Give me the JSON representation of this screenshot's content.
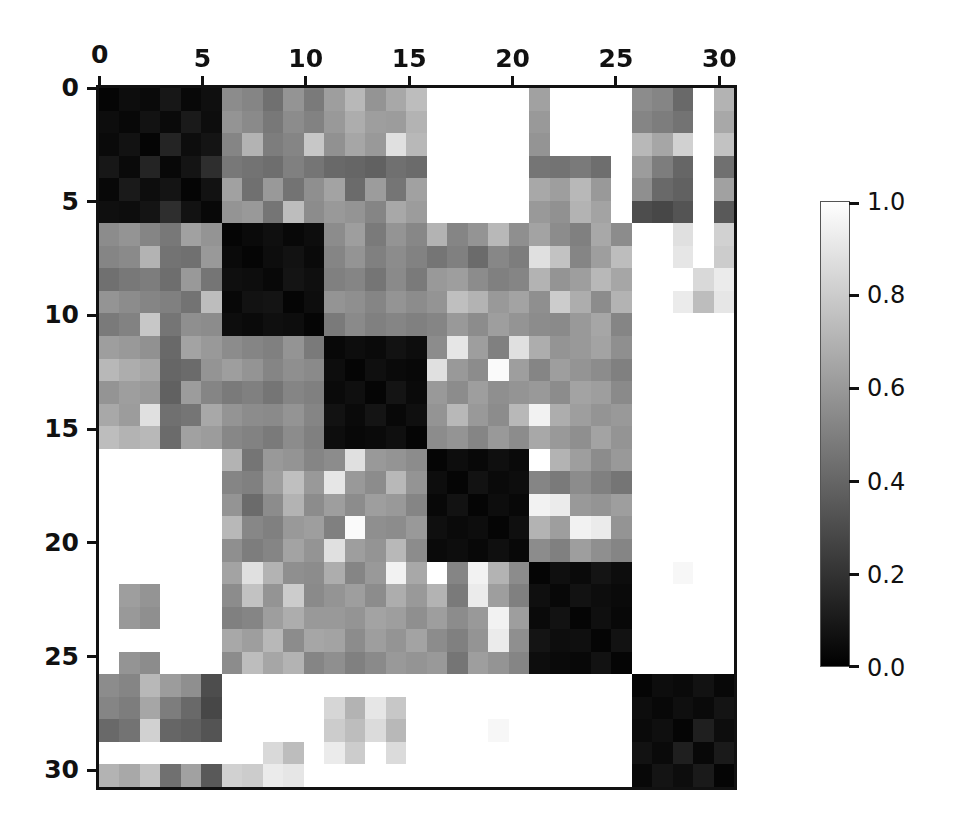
{
  "figure": {
    "type": "heatmap",
    "background": "#ffffff"
  },
  "chart_data": {
    "type": "heatmap",
    "title": "",
    "xlabel": "",
    "ylabel": "",
    "colormap": "gray",
    "vmin": 0.0,
    "vmax": 1.0,
    "grid": false,
    "n_rows": 31,
    "n_cols": 31,
    "x_tick_values": [
      0,
      5,
      10,
      15,
      20,
      25,
      30
    ],
    "y_tick_values": [
      0,
      5,
      10,
      15,
      20,
      25,
      30
    ],
    "x_tick_labels": [
      "0",
      "5",
      "10",
      "15",
      "20",
      "25",
      "30"
    ],
    "y_tick_labels": [
      "0",
      "5",
      "10",
      "15",
      "20",
      "25",
      "30"
    ],
    "x_axis_position": "top",
    "y_axis_position": "left",
    "xlim": [
      0,
      31
    ],
    "ylim": [
      31,
      0
    ],
    "legend_position": "right",
    "colorbar": {
      "orientation": "vertical",
      "tick_values": [
        0.0,
        0.2,
        0.4,
        0.6,
        0.8,
        1.0
      ],
      "tick_labels": [
        "0.0",
        "0.2",
        "0.4",
        "0.6",
        "0.8",
        "1.0"
      ],
      "low_color": "#000000",
      "high_color": "#ffffff"
    },
    "block_structure": {
      "description": "block-diagonal clustered dissimilarity matrix",
      "blocks": [
        [
          0,
          5
        ],
        [
          6,
          10
        ],
        [
          11,
          15
        ],
        [
          16,
          20
        ],
        [
          21,
          25
        ],
        [
          26,
          30
        ]
      ]
    },
    "values": [
      [
        0.02,
        0.05,
        0.04,
        0.09,
        0.03,
        0.06,
        0.55,
        0.52,
        0.44,
        0.58,
        0.48,
        0.62,
        0.72,
        0.58,
        0.66,
        0.74,
        1.0,
        1.0,
        1.0,
        1.0,
        1.0,
        0.63,
        1.0,
        1.0,
        1.0,
        1.0,
        0.55,
        0.52,
        0.41,
        1.0,
        0.7
      ],
      [
        0.05,
        0.03,
        0.07,
        0.04,
        0.1,
        0.05,
        0.58,
        0.54,
        0.47,
        0.55,
        0.51,
        0.6,
        0.68,
        0.62,
        0.61,
        0.7,
        1.0,
        1.0,
        1.0,
        1.0,
        1.0,
        0.6,
        1.0,
        1.0,
        1.0,
        1.0,
        0.52,
        0.49,
        0.45,
        1.0,
        0.66
      ],
      [
        0.04,
        0.07,
        0.02,
        0.14,
        0.05,
        0.08,
        0.52,
        0.7,
        0.49,
        0.52,
        0.78,
        0.57,
        0.65,
        0.6,
        0.88,
        0.72,
        1.0,
        1.0,
        1.0,
        1.0,
        1.0,
        0.58,
        1.0,
        1.0,
        1.0,
        1.0,
        0.72,
        0.65,
        0.82,
        1.0,
        0.76
      ],
      [
        0.09,
        0.04,
        0.14,
        0.03,
        0.08,
        0.18,
        0.47,
        0.45,
        0.43,
        0.5,
        0.46,
        0.41,
        0.4,
        0.38,
        0.44,
        0.42,
        1.0,
        1.0,
        1.0,
        1.0,
        1.0,
        0.46,
        0.45,
        0.48,
        0.43,
        1.0,
        0.61,
        0.49,
        0.4,
        1.0,
        0.44
      ],
      [
        0.03,
        0.1,
        0.05,
        0.08,
        0.02,
        0.07,
        0.63,
        0.44,
        0.6,
        0.45,
        0.56,
        0.64,
        0.42,
        0.61,
        0.46,
        0.63,
        1.0,
        1.0,
        1.0,
        1.0,
        1.0,
        0.66,
        0.62,
        0.72,
        0.6,
        1.0,
        0.56,
        0.41,
        0.38,
        1.0,
        0.63
      ],
      [
        0.06,
        0.05,
        0.08,
        0.18,
        0.07,
        0.03,
        0.58,
        0.6,
        0.46,
        0.74,
        0.55,
        0.6,
        0.58,
        0.52,
        0.66,
        0.61,
        1.0,
        1.0,
        1.0,
        1.0,
        1.0,
        0.6,
        0.57,
        0.7,
        0.64,
        1.0,
        0.3,
        0.28,
        0.33,
        1.0,
        0.35
      ],
      [
        0.55,
        0.58,
        0.52,
        0.47,
        0.63,
        0.58,
        0.02,
        0.04,
        0.06,
        0.03,
        0.05,
        0.55,
        0.62,
        0.48,
        0.58,
        0.53,
        0.7,
        0.52,
        0.58,
        0.72,
        0.56,
        0.64,
        0.55,
        0.5,
        0.66,
        0.55,
        1.0,
        1.0,
        0.88,
        1.0,
        0.82
      ],
      [
        0.52,
        0.54,
        0.7,
        0.45,
        0.44,
        0.6,
        0.04,
        0.02,
        0.05,
        0.07,
        0.04,
        0.52,
        0.58,
        0.5,
        0.55,
        0.51,
        0.46,
        0.5,
        0.42,
        0.53,
        0.49,
        0.88,
        0.76,
        0.52,
        0.62,
        0.74,
        1.0,
        1.0,
        0.9,
        1.0,
        0.8
      ],
      [
        0.44,
        0.47,
        0.49,
        0.43,
        0.6,
        0.46,
        0.06,
        0.05,
        0.03,
        0.08,
        0.06,
        0.5,
        0.52,
        0.46,
        0.54,
        0.48,
        0.6,
        0.62,
        0.55,
        0.5,
        0.52,
        0.7,
        0.58,
        0.62,
        0.72,
        0.65,
        1.0,
        1.0,
        1.0,
        0.85,
        0.92
      ],
      [
        0.58,
        0.55,
        0.52,
        0.5,
        0.45,
        0.74,
        0.03,
        0.07,
        0.08,
        0.02,
        0.05,
        0.58,
        0.56,
        0.52,
        0.58,
        0.55,
        0.58,
        0.75,
        0.7,
        0.6,
        0.64,
        0.56,
        0.8,
        0.68,
        0.55,
        0.7,
        1.0,
        1.0,
        0.92,
        0.74,
        0.9
      ],
      [
        0.48,
        0.51,
        0.78,
        0.46,
        0.56,
        0.55,
        0.05,
        0.04,
        0.06,
        0.05,
        0.02,
        0.48,
        0.54,
        0.5,
        0.52,
        0.5,
        0.52,
        0.6,
        0.55,
        0.62,
        0.58,
        0.55,
        0.54,
        0.6,
        0.65,
        0.52,
        1.0,
        1.0,
        1.0,
        1.0,
        1.0
      ],
      [
        0.62,
        0.6,
        0.57,
        0.41,
        0.64,
        0.6,
        0.55,
        0.52,
        0.5,
        0.58,
        0.48,
        0.03,
        0.05,
        0.04,
        0.07,
        0.05,
        0.55,
        0.9,
        0.62,
        0.5,
        0.88,
        0.68,
        0.58,
        0.6,
        0.64,
        0.56,
        1.0,
        1.0,
        1.0,
        1.0,
        1.0
      ],
      [
        0.72,
        0.68,
        0.65,
        0.4,
        0.42,
        0.58,
        0.62,
        0.58,
        0.52,
        0.56,
        0.54,
        0.05,
        0.02,
        0.06,
        0.04,
        0.03,
        0.88,
        0.6,
        0.55,
        0.98,
        0.62,
        0.52,
        0.62,
        0.58,
        0.55,
        0.5,
        1.0,
        1.0,
        1.0,
        1.0,
        1.0
      ],
      [
        0.58,
        0.62,
        0.6,
        0.38,
        0.61,
        0.52,
        0.48,
        0.5,
        0.46,
        0.52,
        0.5,
        0.04,
        0.06,
        0.02,
        0.08,
        0.04,
        0.6,
        0.55,
        0.62,
        0.56,
        0.58,
        0.6,
        0.55,
        0.64,
        0.62,
        0.54,
        1.0,
        1.0,
        1.0,
        1.0,
        1.0
      ],
      [
        0.66,
        0.61,
        0.88,
        0.44,
        0.46,
        0.66,
        0.58,
        0.55,
        0.54,
        0.58,
        0.52,
        0.07,
        0.04,
        0.08,
        0.03,
        0.06,
        0.58,
        0.72,
        0.6,
        0.55,
        0.72,
        0.95,
        0.68,
        0.62,
        0.58,
        0.6,
        1.0,
        1.0,
        1.0,
        1.0,
        1.0
      ],
      [
        0.74,
        0.7,
        0.72,
        0.42,
        0.63,
        0.61,
        0.53,
        0.51,
        0.48,
        0.55,
        0.5,
        0.05,
        0.03,
        0.04,
        0.06,
        0.02,
        0.55,
        0.58,
        0.52,
        0.6,
        0.55,
        0.66,
        0.6,
        0.56,
        0.64,
        0.58,
        1.0,
        1.0,
        1.0,
        1.0,
        1.0
      ],
      [
        1.0,
        1.0,
        1.0,
        1.0,
        1.0,
        1.0,
        0.7,
        0.46,
        0.6,
        0.58,
        0.52,
        0.55,
        0.88,
        0.6,
        0.58,
        0.55,
        0.02,
        0.05,
        0.03,
        0.06,
        0.04,
        1.0,
        0.7,
        0.62,
        0.55,
        0.6,
        1.0,
        1.0,
        1.0,
        1.0,
        1.0
      ],
      [
        1.0,
        1.0,
        1.0,
        1.0,
        1.0,
        1.0,
        0.52,
        0.5,
        0.62,
        0.75,
        0.6,
        0.9,
        0.6,
        0.55,
        0.72,
        0.58,
        0.05,
        0.02,
        0.07,
        0.04,
        0.05,
        0.52,
        0.48,
        0.55,
        0.5,
        0.46,
        1.0,
        1.0,
        1.0,
        1.0,
        1.0
      ],
      [
        1.0,
        1.0,
        1.0,
        1.0,
        1.0,
        1.0,
        0.58,
        0.42,
        0.55,
        0.7,
        0.55,
        0.62,
        0.55,
        0.62,
        0.6,
        0.52,
        0.03,
        0.07,
        0.02,
        0.05,
        0.03,
        0.95,
        0.92,
        0.6,
        0.58,
        0.62,
        1.0,
        1.0,
        1.0,
        1.0,
        1.0
      ],
      [
        1.0,
        1.0,
        1.0,
        1.0,
        1.0,
        1.0,
        0.72,
        0.53,
        0.5,
        0.6,
        0.62,
        0.5,
        0.98,
        0.56,
        0.55,
        0.6,
        0.06,
        0.04,
        0.05,
        0.02,
        0.06,
        0.7,
        0.62,
        0.95,
        0.92,
        0.58,
        1.0,
        1.0,
        1.0,
        1.0,
        1.0
      ],
      [
        1.0,
        1.0,
        1.0,
        1.0,
        1.0,
        1.0,
        0.56,
        0.49,
        0.52,
        0.64,
        0.58,
        0.88,
        0.62,
        0.58,
        0.72,
        0.55,
        0.04,
        0.05,
        0.03,
        0.06,
        0.03,
        0.55,
        0.5,
        0.62,
        0.56,
        0.52,
        1.0,
        1.0,
        1.0,
        1.0,
        1.0
      ],
      [
        1.0,
        1.0,
        1.0,
        1.0,
        1.0,
        1.0,
        0.64,
        0.88,
        0.7,
        0.56,
        0.55,
        0.68,
        0.52,
        0.6,
        0.95,
        0.66,
        1.0,
        0.52,
        0.95,
        0.7,
        0.55,
        0.02,
        0.06,
        0.04,
        0.08,
        0.05,
        1.0,
        1.0,
        0.97,
        1.0,
        1.0
      ],
      [
        1.0,
        0.62,
        0.58,
        1.0,
        1.0,
        1.0,
        0.55,
        0.76,
        0.58,
        0.8,
        0.54,
        0.58,
        0.62,
        0.55,
        0.68,
        0.6,
        0.7,
        0.48,
        0.92,
        0.62,
        0.5,
        0.06,
        0.03,
        0.07,
        0.05,
        0.04,
        1.0,
        1.0,
        1.0,
        1.0,
        1.0
      ],
      [
        1.0,
        0.6,
        0.56,
        1.0,
        1.0,
        1.0,
        0.5,
        0.52,
        0.62,
        0.68,
        0.6,
        0.6,
        0.58,
        0.64,
        0.62,
        0.56,
        0.62,
        0.55,
        0.6,
        0.95,
        0.62,
        0.04,
        0.07,
        0.02,
        0.06,
        0.03,
        1.0,
        1.0,
        1.0,
        1.0,
        1.0
      ],
      [
        1.0,
        1.0,
        1.0,
        1.0,
        1.0,
        1.0,
        0.66,
        0.62,
        0.72,
        0.55,
        0.65,
        0.64,
        0.55,
        0.62,
        0.58,
        0.64,
        0.55,
        0.5,
        0.58,
        0.92,
        0.56,
        0.08,
        0.05,
        0.06,
        0.02,
        0.07,
        1.0,
        1.0,
        1.0,
        1.0,
        1.0
      ],
      [
        1.0,
        0.58,
        0.55,
        1.0,
        1.0,
        1.0,
        0.55,
        0.74,
        0.65,
        0.7,
        0.52,
        0.56,
        0.5,
        0.54,
        0.6,
        0.58,
        0.6,
        0.46,
        0.62,
        0.58,
        0.52,
        0.05,
        0.04,
        0.03,
        0.07,
        0.02,
        1.0,
        1.0,
        1.0,
        1.0,
        1.0
      ],
      [
        0.55,
        0.52,
        0.72,
        0.61,
        0.56,
        0.3,
        1.0,
        1.0,
        1.0,
        1.0,
        1.0,
        1.0,
        1.0,
        1.0,
        1.0,
        1.0,
        1.0,
        1.0,
        1.0,
        1.0,
        1.0,
        1.0,
        1.0,
        1.0,
        1.0,
        1.0,
        0.02,
        0.05,
        0.04,
        0.07,
        0.03
      ],
      [
        0.52,
        0.49,
        0.65,
        0.49,
        0.41,
        0.28,
        1.0,
        1.0,
        1.0,
        1.0,
        1.0,
        0.84,
        0.7,
        0.9,
        0.78,
        1.0,
        1.0,
        1.0,
        1.0,
        1.0,
        1.0,
        1.0,
        1.0,
        1.0,
        1.0,
        1.0,
        0.05,
        0.03,
        0.06,
        0.04,
        0.08
      ],
      [
        0.41,
        0.45,
        0.82,
        0.4,
        0.38,
        0.33,
        1.0,
        1.0,
        1.0,
        1.0,
        1.0,
        0.8,
        0.74,
        0.86,
        0.72,
        1.0,
        1.0,
        1.0,
        1.0,
        0.97,
        1.0,
        1.0,
        1.0,
        1.0,
        1.0,
        1.0,
        0.04,
        0.06,
        0.02,
        0.12,
        0.05
      ],
      [
        1.0,
        1.0,
        1.0,
        1.0,
        1.0,
        1.0,
        1.0,
        1.0,
        0.85,
        0.74,
        1.0,
        0.92,
        0.8,
        1.0,
        0.86,
        1.0,
        1.0,
        1.0,
        1.0,
        1.0,
        1.0,
        1.0,
        1.0,
        1.0,
        1.0,
        1.0,
        0.07,
        0.04,
        0.12,
        0.03,
        0.1
      ],
      [
        0.7,
        0.66,
        0.76,
        0.44,
        0.63,
        0.35,
        0.82,
        0.8,
        0.92,
        0.9,
        1.0,
        1.0,
        1.0,
        1.0,
        1.0,
        1.0,
        1.0,
        1.0,
        1.0,
        1.0,
        1.0,
        1.0,
        1.0,
        1.0,
        1.0,
        1.0,
        0.03,
        0.08,
        0.05,
        0.1,
        0.02
      ]
    ]
  }
}
